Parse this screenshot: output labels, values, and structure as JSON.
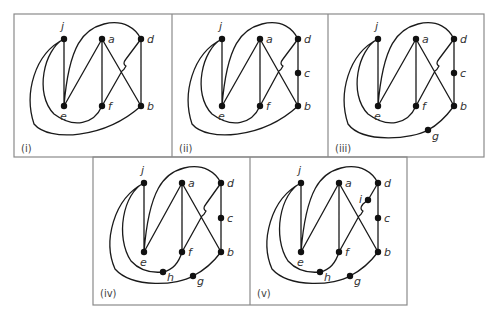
{
  "figure": {
    "panels": [
      {
        "label": "(i)",
        "nodes": [
          "j",
          "a",
          "d",
          "e",
          "f",
          "b"
        ]
      },
      {
        "label": "(ii)",
        "nodes": [
          "j",
          "a",
          "d",
          "c",
          "e",
          "f",
          "b"
        ]
      },
      {
        "label": "(iii)",
        "nodes": [
          "j",
          "a",
          "d",
          "c",
          "e",
          "f",
          "b",
          "g"
        ]
      },
      {
        "label": "(iv)",
        "nodes": [
          "j",
          "a",
          "d",
          "c",
          "e",
          "f",
          "b",
          "h",
          "g"
        ]
      },
      {
        "label": "(v)",
        "nodes": [
          "j",
          "a",
          "d",
          "i",
          "c",
          "e",
          "f",
          "b",
          "h",
          "g"
        ]
      }
    ],
    "node_labels": {
      "j": "j",
      "a": "a",
      "d": "d",
      "c": "c",
      "e": "e",
      "f": "f",
      "b": "b",
      "g": "g",
      "h": "h",
      "i": "i"
    }
  }
}
